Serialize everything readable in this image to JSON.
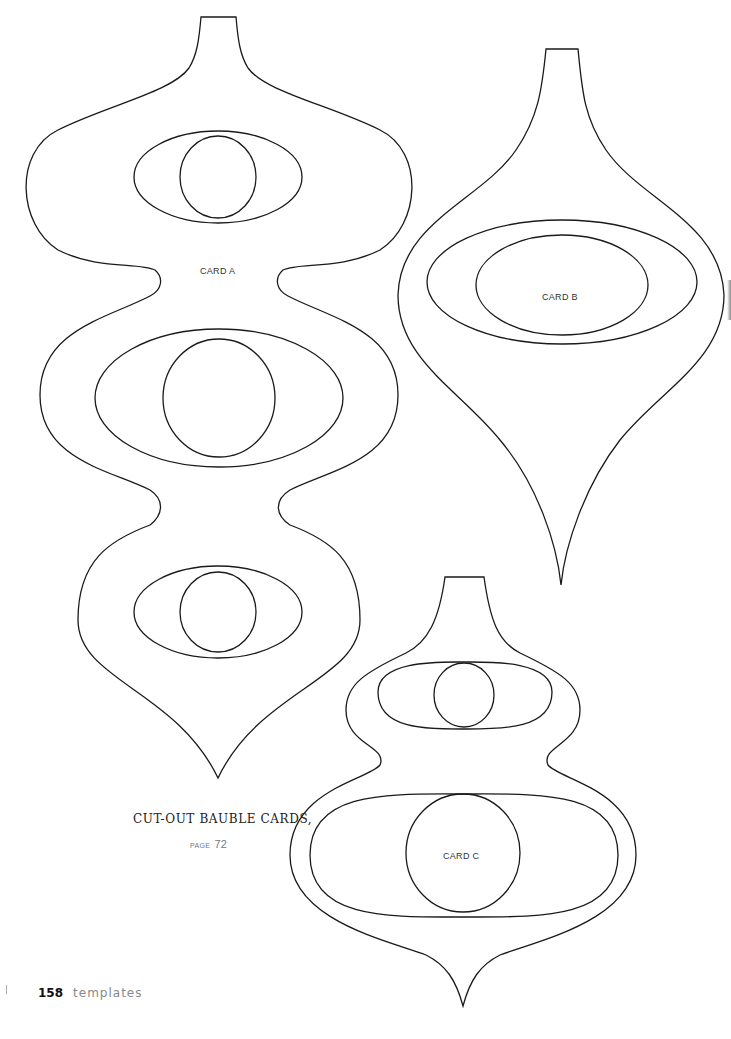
{
  "page": {
    "number": "158",
    "section": "templates"
  },
  "caption": {
    "title": "CUT-OUT BAUBLE CARDS,",
    "page_label": "PAGE",
    "page_ref": "72"
  },
  "cards": [
    {
      "id": "A",
      "label": "CARD A"
    },
    {
      "id": "B",
      "label": "CARD B"
    },
    {
      "id": "C",
      "label": "CARD C"
    }
  ],
  "colors": {
    "outline": "#1a1a1a",
    "background": "#ffffff",
    "caption_text": "#222222",
    "muted_text": "#888888"
  }
}
